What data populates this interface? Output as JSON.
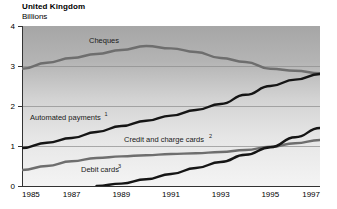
{
  "header": {
    "title": "United Kingdom",
    "subtitle": "Billions"
  },
  "chart_data": {
    "type": "line",
    "title": "United Kingdom",
    "subtitle": "Billions",
    "xlabel": "",
    "ylabel": "Billions",
    "xlim": [
      1985,
      1997
    ],
    "ylim": [
      0,
      4
    ],
    "grid": true,
    "legend": "inline-labels",
    "x_ticks": [
      "1985",
      "1987",
      "1989",
      "1991",
      "1993",
      "1995",
      "1997"
    ],
    "x_tick_values": [
      1985,
      1987,
      1989,
      1991,
      1993,
      1995,
      1997
    ],
    "y_ticks": [
      "0",
      "1",
      "2",
      "3",
      "4"
    ],
    "y_tick_values": [
      0,
      1,
      2,
      3,
      4
    ],
    "x": [
      1985,
      1986,
      1987,
      1988,
      1989,
      1990,
      1991,
      1992,
      1993,
      1994,
      1995,
      1996,
      1997
    ],
    "series": [
      {
        "name": "Cheques",
        "label": "Cheques",
        "footnote": "",
        "color": "#6e6e6e",
        "values": [
          2.93,
          3.08,
          3.2,
          3.3,
          3.4,
          3.5,
          3.44,
          3.35,
          3.2,
          3.1,
          2.93,
          2.88,
          2.82
        ]
      },
      {
        "name": "Automated payments",
        "label": "Automated payments",
        "footnote": "1",
        "color": "#151515",
        "values": [
          0.95,
          1.08,
          1.2,
          1.35,
          1.5,
          1.63,
          1.76,
          1.9,
          2.05,
          2.28,
          2.5,
          2.66,
          2.8
        ]
      },
      {
        "name": "Credit and charge cards",
        "label": "Credit and charge cards",
        "footnote": "2",
        "color": "#6e6e6e",
        "values": [
          0.4,
          0.5,
          0.62,
          0.7,
          0.74,
          0.77,
          0.8,
          0.82,
          0.85,
          0.9,
          0.98,
          1.07,
          1.15
        ]
      },
      {
        "name": "Debit cards",
        "label": "Debit cards",
        "footnote": "3",
        "color": "#151515",
        "values": [
          null,
          null,
          null,
          0.0,
          0.06,
          0.17,
          0.3,
          0.45,
          0.6,
          0.78,
          0.97,
          1.22,
          1.45
        ]
      }
    ],
    "annotations": [
      {
        "text": "Cheques",
        "x": 1988.3,
        "y": 3.72
      },
      {
        "text": "Automated payments",
        "x": 1985.35,
        "y": 1.62,
        "sup": "1"
      },
      {
        "text": "Credit and charge cards",
        "x": 1989.6,
        "y": 1.07,
        "sup": "2"
      },
      {
        "text": "Debit cards",
        "x": 1988.4,
        "y": 0.33,
        "sup": "3"
      }
    ],
    "plot_background": {
      "gradient_from": "#a9a9a9",
      "gradient_to": "#f2f2f2"
    }
  }
}
